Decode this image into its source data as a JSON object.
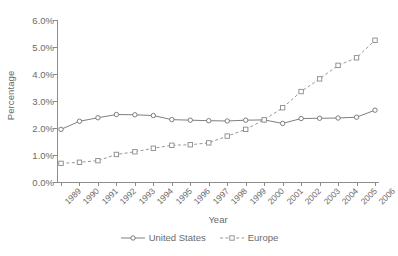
{
  "chart_data": {
    "type": "line",
    "title": "",
    "xlabel": "Year",
    "ylabel": "Percentage",
    "categories": [
      "1989",
      "1990",
      "1991",
      "1992",
      "1993",
      "1994",
      "1995",
      "1996",
      "1997",
      "1998",
      "1999",
      "2000",
      "2001",
      "2002",
      "2003",
      "2004",
      "2005",
      "2006"
    ],
    "x": [
      "1989",
      "1990",
      "1991",
      "1992",
      "1993",
      "1994",
      "1995",
      "1996",
      "1997",
      "1998",
      "1999",
      "2000",
      "2001",
      "2002",
      "2003",
      "2004",
      "2005",
      "2006"
    ],
    "ylim": [
      0.0,
      6.0
    ],
    "yticks": [
      "0.0%",
      "1.0%",
      "2.0%",
      "3.0%",
      "4.0%",
      "5.0%",
      "6.0%"
    ],
    "ytick_values": [
      0.0,
      1.0,
      2.0,
      3.0,
      4.0,
      5.0,
      6.0
    ],
    "grid": false,
    "legend_position": "bottom",
    "series": [
      {
        "name": "United States",
        "marker": "circle",
        "linestyle": "solid",
        "color": "#707070",
        "values": [
          1.95,
          2.25,
          2.38,
          2.5,
          2.49,
          2.46,
          2.31,
          2.29,
          2.27,
          2.26,
          2.29,
          2.3,
          2.17,
          2.35,
          2.36,
          2.37,
          2.4,
          2.66
        ]
      },
      {
        "name": "Europe",
        "marker": "square",
        "linestyle": "dashed",
        "color": "#8a8a8a",
        "values": [
          0.69,
          0.73,
          0.79,
          1.02,
          1.12,
          1.25,
          1.36,
          1.38,
          1.45,
          1.7,
          1.95,
          2.3,
          2.75,
          3.35,
          3.82,
          4.32,
          4.6,
          5.25
        ]
      }
    ]
  },
  "axis": {
    "ylabel": "Percentage",
    "xlabel": "Year"
  },
  "legend": {
    "items": [
      {
        "label": "United States"
      },
      {
        "label": "Europe"
      }
    ]
  }
}
